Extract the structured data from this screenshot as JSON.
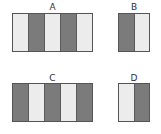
{
  "panels": [
    {
      "label": "A",
      "stripes": [
        "light",
        "dark",
        "light",
        "dark",
        "light"
      ]
    },
    {
      "label": "B",
      "stripes": [
        "dark",
        "light"
      ]
    },
    {
      "label": "C",
      "stripes": [
        "dark",
        "light",
        "dark",
        "light",
        "dark"
      ]
    },
    {
      "label": "D",
      "stripes": [
        "light",
        "dark"
      ]
    }
  ],
  "colors": {
    "light": "#ececec",
    "dark": "#7b7b7b",
    "border": "#555555"
  }
}
